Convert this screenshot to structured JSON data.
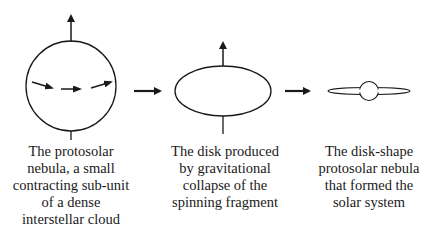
{
  "stages": [
    {
      "id": "protosolar-nebula",
      "shape": "sphere",
      "caption": "The protosolar\nnebula, a small\ncontracting sub-unit\nof a dense\ninterstellar cloud"
    },
    {
      "id": "collapsed-disk",
      "shape": "ellipse",
      "caption": "The disk produced\nby gravitational\ncollapse of the\nspinning fragment"
    },
    {
      "id": "disk-shape-nebula",
      "shape": "flattened-disk-with-central-sphere",
      "caption": "The disk-shape\nprotosolar nebula\nthat formed the\nsolar system"
    }
  ],
  "connectors": [
    {
      "from": "protosolar-nebula",
      "to": "collapsed-disk",
      "icon": "arrow-right-icon"
    },
    {
      "from": "collapsed-disk",
      "to": "disk-shape-nebula",
      "icon": "arrow-right-icon"
    }
  ],
  "colors": {
    "stroke": "#1a1a1a",
    "background": "#ffffff"
  }
}
